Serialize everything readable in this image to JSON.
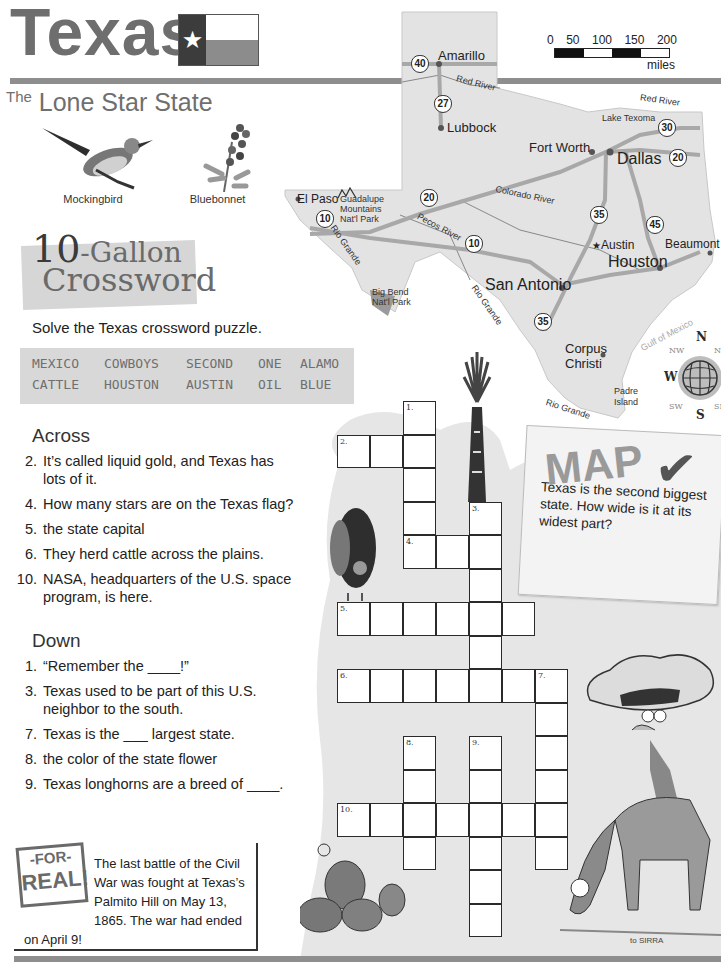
{
  "header": {
    "title": "Texas",
    "flag_star": "★",
    "subtitle_prefix": "The",
    "subtitle": "Lone Star State"
  },
  "symbols": [
    {
      "name": "mockingbird",
      "label": "Mockingbird"
    },
    {
      "name": "bluebonnet",
      "label": "Bluebonnet"
    }
  ],
  "map": {
    "scale": {
      "ticks": [
        "0",
        "50",
        "100",
        "150",
        "200"
      ],
      "unit": "miles"
    },
    "cities": [
      {
        "name": "Amarillo"
      },
      {
        "name": "Lubbock"
      },
      {
        "name": "Fort Worth"
      },
      {
        "name": "Dallas"
      },
      {
        "name": "El Paso"
      },
      {
        "name": "Austin",
        "capital": true
      },
      {
        "name": "Houston"
      },
      {
        "name": "Beaumont"
      },
      {
        "name": "San Antonio"
      },
      {
        "name": "Corpus Christi"
      }
    ],
    "places": {
      "guadalupe": "Guadalupe Mountains Nat'l Park",
      "big_bend": "Big Bend Nat'l Park",
      "lake_texoma": "Lake Texoma",
      "padre_island": "Padre Island",
      "gulf": "Gulf of Mexico"
    },
    "rivers": {
      "red_river_1": "Red River",
      "red_river_2": "Red River",
      "colorado": "Colorado River",
      "pecos": "Pecos River",
      "rio_grande_1": "Rio Grande",
      "rio_grande_2": "Rio Grande",
      "rio_grande_3": "Rio Grande"
    },
    "highways": {
      "i40": "40",
      "i27": "27",
      "i30": "30",
      "i20_east": "20",
      "i20_west": "20",
      "i10_west": "10",
      "i10_central": "10",
      "i35_north": "35",
      "i35_south": "35",
      "i45": "45"
    },
    "compass": {
      "n": "N",
      "s": "S",
      "w": "W",
      "e": "E",
      "nw": "NW",
      "ne": "NE",
      "sw": "SW",
      "se": "SE"
    }
  },
  "crossword": {
    "title_ten": "10",
    "title_gallon": "-Gallon",
    "title_crossword": "Crossword",
    "instructions": "Solve the Texas crossword puzzle.",
    "word_bank": [
      [
        "MEXICO",
        "COWBOYS",
        "SECOND",
        "ONE",
        "ALAMO"
      ],
      [
        "CATTLE",
        "HOUSTON",
        "AUSTIN",
        "OIL",
        "BLUE"
      ]
    ],
    "across_heading": "Across",
    "across": [
      {
        "num": "2.",
        "text": "It’s called liquid gold, and Texas has lots of it."
      },
      {
        "num": "4.",
        "text": "How many stars are on the Texas flag?"
      },
      {
        "num": "5.",
        "text": "the state capital"
      },
      {
        "num": "6.",
        "text": "They herd cattle across the plains."
      },
      {
        "num": "10.",
        "text": "NASA, headquarters of the U.S. space program, is here."
      }
    ],
    "down_heading": "Down",
    "down": [
      {
        "num": "1.",
        "text": "“Remember the ____!”"
      },
      {
        "num": "3.",
        "text": "Texas used to be part of this U.S. neighbor to the south."
      },
      {
        "num": "7.",
        "text": "Texas is the ___ largest state."
      },
      {
        "num": "8.",
        "text": "the color of the state flower"
      },
      {
        "num": "9.",
        "text": "Texas longhorns are a breed of ____."
      }
    ],
    "grid_numbers": {
      "n1": "1.",
      "n2": "2.",
      "n3": "3.",
      "n4": "4.",
      "n5": "5.",
      "n6": "6.",
      "n7": "7.",
      "n8": "8.",
      "n9": "9.",
      "n10": "10."
    }
  },
  "map_check": {
    "title": "MAP",
    "check": "✔",
    "text": "Texas is the second biggest state. How wide is it at its widest part?"
  },
  "for_real": {
    "badge_top": "-FOR-",
    "badge_bottom": "REAL!",
    "text": "The last battle of the Civil War was fought at Texas’s Palmito Hill on May 13, 1865. The war had ended on April 9!"
  },
  "artist_signature": "to SIRRA"
}
